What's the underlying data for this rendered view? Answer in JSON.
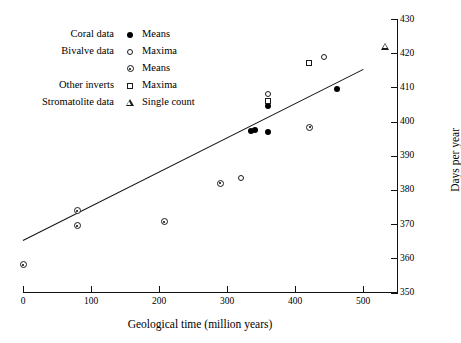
{
  "chart_data": {
    "type": "scatter",
    "title": "",
    "xlabel": "Geological time (million years)",
    "ylabel": "Days per year",
    "xlim": [
      0,
      530
    ],
    "ylim": [
      350,
      430
    ],
    "xticks": [
      0,
      100,
      200,
      300,
      400,
      500
    ],
    "yticks": [
      350,
      360,
      370,
      380,
      390,
      400,
      410,
      420,
      430
    ],
    "grid": false,
    "legend_position": "upper-left",
    "series": [
      {
        "name": "Means",
        "group": "Coral data",
        "marker": "filled-circle",
        "points": [
          {
            "x": 335,
            "y": 399.5
          },
          {
            "x": 341,
            "y": 399.8
          },
          {
            "x": 360,
            "y": 399.2
          },
          {
            "x": 360,
            "y": 407.0
          },
          {
            "x": 462,
            "y": 412.0
          }
        ]
      },
      {
        "name": "Maxima",
        "group": "Bivalve data",
        "marker": "open-circle",
        "points": [
          {
            "x": 320,
            "y": 385.8
          },
          {
            "x": 360,
            "y": 410.5
          },
          {
            "x": 442,
            "y": 421.3
          }
        ]
      },
      {
        "name": "Means",
        "group": "Bivalve data",
        "marker": "dotted-circle",
        "points": [
          {
            "x": 0,
            "y": 360.2
          },
          {
            "x": 80,
            "y": 376.0
          },
          {
            "x": 80,
            "y": 371.6
          },
          {
            "x": 208,
            "y": 372.7
          },
          {
            "x": 290,
            "y": 384.0
          },
          {
            "x": 422,
            "y": 400.4
          }
        ]
      },
      {
        "name": "Maxima",
        "group": "Other inverts",
        "marker": "open-square",
        "points": [
          {
            "x": 360,
            "y": 408.5
          },
          {
            "x": 420,
            "y": 419.5
          }
        ]
      },
      {
        "name": "Single count",
        "group": "Stromatolite data",
        "marker": "open-triangle",
        "points": [
          {
            "x": 533,
            "y": 424.0
          }
        ]
      }
    ],
    "trendline": {
      "x_start": 0,
      "y_start": 365.5,
      "x_end": 500,
      "y_end": 415.5
    }
  },
  "legend": {
    "rows": [
      {
        "label": "Coral data",
        "marker": "filled-circle",
        "name": "Means"
      },
      {
        "label": "Bivalve data",
        "marker": "open-circle",
        "name": "Maxima"
      },
      {
        "label": "",
        "marker": "dotted-circle",
        "name": "Means"
      },
      {
        "label": "Other inverts",
        "marker": "open-square",
        "name": "Maxima"
      },
      {
        "label": "Stromatolite data",
        "marker": "open-triangle",
        "name": "Single count"
      }
    ]
  },
  "axes": {
    "x": {
      "label": "Geological time (million years)",
      "tick_labels": [
        "0",
        "100",
        "200",
        "300",
        "400",
        "500"
      ]
    },
    "y": {
      "label": "Days per year",
      "tick_labels": [
        "350",
        "360",
        "370",
        "380",
        "390",
        "400",
        "410",
        "420",
        "430"
      ]
    }
  }
}
